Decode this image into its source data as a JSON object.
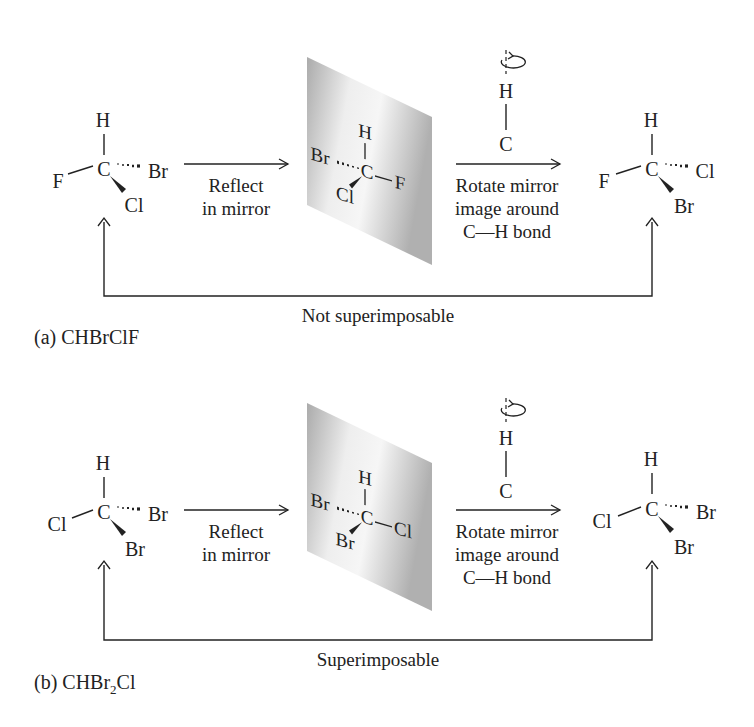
{
  "panel_a": {
    "caption": "(a) CHBrClF",
    "result_label": "Not superimposable",
    "step1_label_line1": "Reflect",
    "step1_label_line2": "in mirror",
    "step2_label_line1": "Rotate mirror",
    "step2_label_line2": "image around",
    "step2_label_line3": "C—H bond",
    "original": {
      "top": "H",
      "center": "C",
      "left": "F",
      "dash": "Br",
      "wedge": "Cl"
    },
    "mirror": {
      "top": "H",
      "center": "C",
      "dash": "Br",
      "wedge": "Cl",
      "right": "F"
    },
    "rotated": {
      "top": "H",
      "center": "C",
      "left": "F",
      "dash": "Cl",
      "wedge": "Br"
    },
    "axis": {
      "top": "H",
      "bottom": "C"
    }
  },
  "panel_b": {
    "caption_prefix": "(b) CHBr",
    "caption_sub": "2",
    "caption_suffix": "Cl",
    "result_label": "Superimposable",
    "step1_label_line1": "Reflect",
    "step1_label_line2": "in mirror",
    "step2_label_line1": "Rotate mirror",
    "step2_label_line2": "image around",
    "step2_label_line3": "C—H bond",
    "original": {
      "top": "H",
      "center": "C",
      "left": "Cl",
      "dash": "Br",
      "wedge": "Br"
    },
    "mirror": {
      "top": "H",
      "center": "C",
      "dash": "Br",
      "wedge": "Br",
      "right": "Cl"
    },
    "rotated": {
      "top": "H",
      "center": "C",
      "left": "Cl",
      "dash": "Br",
      "wedge": "Br"
    },
    "axis": {
      "top": "H",
      "bottom": "C"
    }
  },
  "icons": {
    "rotation": "rotation-arrow-icon"
  },
  "colors": {
    "ink": "#222222",
    "mirror_light": "#f4f4f4",
    "mirror_dark": "#a8a8a8"
  }
}
